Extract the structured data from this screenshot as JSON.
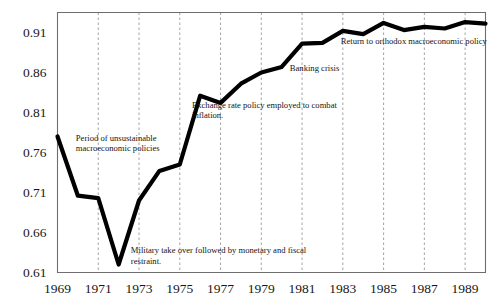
{
  "chart_data": {
    "type": "line",
    "title": "",
    "subtitle": "",
    "xlabel": "",
    "ylabel": "",
    "xlim": [
      1969,
      1990
    ],
    "ylim": [
      0.61,
      0.935
    ],
    "grid": "vertical-dashed-at-xticks",
    "legend": "none",
    "x_tick_labels": [
      "1969",
      "1971",
      "1973",
      "1975",
      "1977",
      "1979",
      "1981",
      "1983",
      "1985",
      "1987",
      "1989"
    ],
    "x_ticks": [
      1969,
      1971,
      1973,
      1975,
      1977,
      1979,
      1981,
      1983,
      1985,
      1987,
      1989
    ],
    "y_tick_labels": [
      "0.61",
      "0.66",
      "0.71",
      "0.76",
      "0.81",
      "0.86",
      "0.91"
    ],
    "y_ticks": [
      0.61,
      0.66,
      0.71,
      0.76,
      0.81,
      0.86,
      0.91
    ],
    "series": [
      {
        "name": "index",
        "x": [
          1969,
          1970,
          1971,
          1972,
          1973,
          1974,
          1975,
          1976,
          1977,
          1978,
          1979,
          1980,
          1981,
          1982,
          1983,
          1984,
          1985,
          1986,
          1987,
          1988,
          1989,
          1990
        ],
        "values": [
          0.78,
          0.706,
          0.703,
          0.62,
          0.7,
          0.737,
          0.745,
          0.831,
          0.822,
          0.846,
          0.86,
          0.867,
          0.896,
          0.897,
          0.912,
          0.908,
          0.922,
          0.913,
          0.917,
          0.915,
          0.923,
          0.921
        ]
      }
    ],
    "annotations": [
      {
        "name": "period-of-unsustainable-macroeconomic-policies",
        "lines": [
          "Period of unsustainable",
          "macroeconomic policies"
        ],
        "x": 1969.9,
        "y": 0.775
      },
      {
        "name": "military-take-over",
        "lines": [
          "Military take over followed by monetary and fiscal",
          "restraint."
        ],
        "x": 1972.6,
        "y": 0.634
      },
      {
        "name": "exchange-rate-policy",
        "lines": [
          "Exchange rate policy employed to combat",
          "inflation."
        ],
        "x": 1975.6,
        "y": 0.816
      },
      {
        "name": "banking-crisis",
        "lines": [
          "Banking crisis"
        ],
        "x": 1980.4,
        "y": 0.862
      },
      {
        "name": "return-to-orthodox-macroeconomic-policy",
        "lines": [
          "Return to orthodox macroeconomic policy"
        ],
        "x": 1982.9,
        "y": 0.896
      }
    ],
    "colors": {
      "line": "#000000",
      "grid": "#8c8c8c",
      "frame": "#6e6e6e",
      "text": "#171717",
      "background": "#ffffff"
    }
  }
}
